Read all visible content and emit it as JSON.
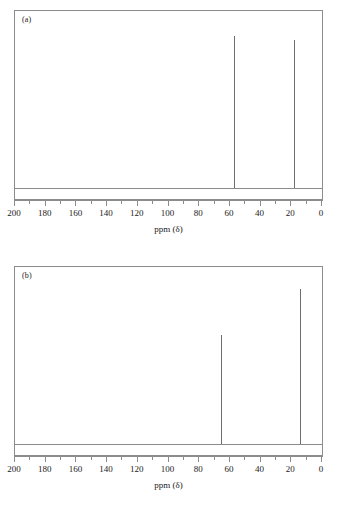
{
  "figure": {
    "axis_title": "ppm (δ)",
    "axis_min": 0,
    "axis_max": 200,
    "major_step": 20,
    "minor_step": 10,
    "tick_labels": [
      "200",
      "180",
      "160",
      "140",
      "120",
      "100",
      "80",
      "60",
      "40",
      "20",
      "0"
    ],
    "line_color": "#8c8c8c",
    "peak_color": "#6e6e6e",
    "background": "#ffffff"
  },
  "panels": [
    {
      "label": "(a)",
      "peaks": [
        {
          "ppm": 57.5,
          "height": 0.92
        },
        {
          "ppm": 18.5,
          "height": 0.9
        }
      ]
    },
    {
      "label": "(b)",
      "peaks": [
        {
          "ppm": 66.0,
          "height": 0.66
        },
        {
          "ppm": 14.5,
          "height": 0.94
        }
      ]
    }
  ],
  "chart_data": {
    "type": "line",
    "title": "",
    "xlabel": "ppm (δ)",
    "ylabel": "",
    "xlim": [
      200,
      0
    ],
    "ylim": [
      0,
      1
    ],
    "grid": false,
    "legend": "none",
    "x_axis_reversed": true,
    "xticks": [
      200,
      180,
      160,
      140,
      120,
      100,
      80,
      60,
      40,
      20,
      0
    ],
    "xtick_labels": [
      "200",
      "180",
      "160",
      "140",
      "120",
      "100",
      "80",
      "60",
      "40",
      "20",
      "0"
    ],
    "minor_xticks": [
      190,
      170,
      150,
      130,
      110,
      90,
      70,
      50,
      30,
      10
    ],
    "subplots": [
      {
        "annotation": "(a)",
        "description": "Carbon-13 NMR spectrum with two singlet peaks",
        "peaks_ppm": [
          57.5,
          18.5
        ],
        "peaks_relative_intensity": [
          0.92,
          0.9
        ]
      },
      {
        "annotation": "(b)",
        "description": "Carbon-13 NMR spectrum with two singlet peaks of unequal intensity",
        "peaks_ppm": [
          66.0,
          14.5
        ],
        "peaks_relative_intensity": [
          0.66,
          0.94
        ]
      }
    ]
  }
}
